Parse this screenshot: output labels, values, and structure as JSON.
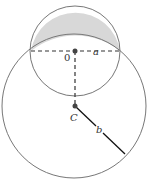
{
  "diagram": {
    "colors": {
      "stroke": "#777777",
      "dashed": "#333333",
      "radius_line": "#111111",
      "shade": "#d8d8d8",
      "point": "#444444",
      "background": "#ffffff"
    },
    "small_circle": {
      "center_label": "0",
      "radius_label": "a",
      "cx": 75,
      "cy": 51,
      "r": 45
    },
    "large_circle": {
      "center_label": "C",
      "radius_label": "b",
      "cx": 74,
      "cy": 106,
      "r": 72
    },
    "shaded_region": "lune of small circle outside large circle",
    "labels": {
      "origin": "0",
      "a": "a",
      "c": "C",
      "b": "b"
    }
  }
}
